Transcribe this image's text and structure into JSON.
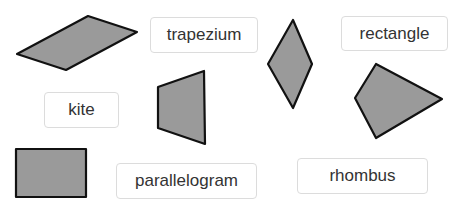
{
  "labels": [
    {
      "id": "trapezium",
      "text": "trapezium",
      "x": 150,
      "y": 17,
      "w": 108,
      "h": 36
    },
    {
      "id": "rectangle",
      "text": "rectangle",
      "x": 341,
      "y": 16,
      "w": 107,
      "h": 35
    },
    {
      "id": "kite",
      "text": "kite",
      "x": 44,
      "y": 92,
      "w": 75,
      "h": 36
    },
    {
      "id": "parallelogram",
      "text": "parallelogram",
      "x": 116,
      "y": 163,
      "w": 141,
      "h": 36
    },
    {
      "id": "rhombus",
      "text": "rhombus",
      "x": 297,
      "y": 158,
      "w": 131,
      "h": 36
    }
  ],
  "shapes": [
    {
      "id": "parallelogram-shape",
      "points": "17,54 88,16 137,32 66,70"
    },
    {
      "id": "trapezium-shape",
      "points": "158,87 204,71 205,144 158,128"
    },
    {
      "id": "rhombus-shape",
      "points": "293,20 312,64 293,108 268,64"
    },
    {
      "id": "kite-shape",
      "points": "376,64 442,99 376,138 355,98"
    },
    {
      "id": "rectangle-shape",
      "points": "16,149 86,149 86,197 16,197"
    }
  ],
  "colors": {
    "shape_fill": "#9a9a9a",
    "shape_stroke": "#111111",
    "label_border": "#dcdcdc",
    "label_text": "#333333"
  }
}
